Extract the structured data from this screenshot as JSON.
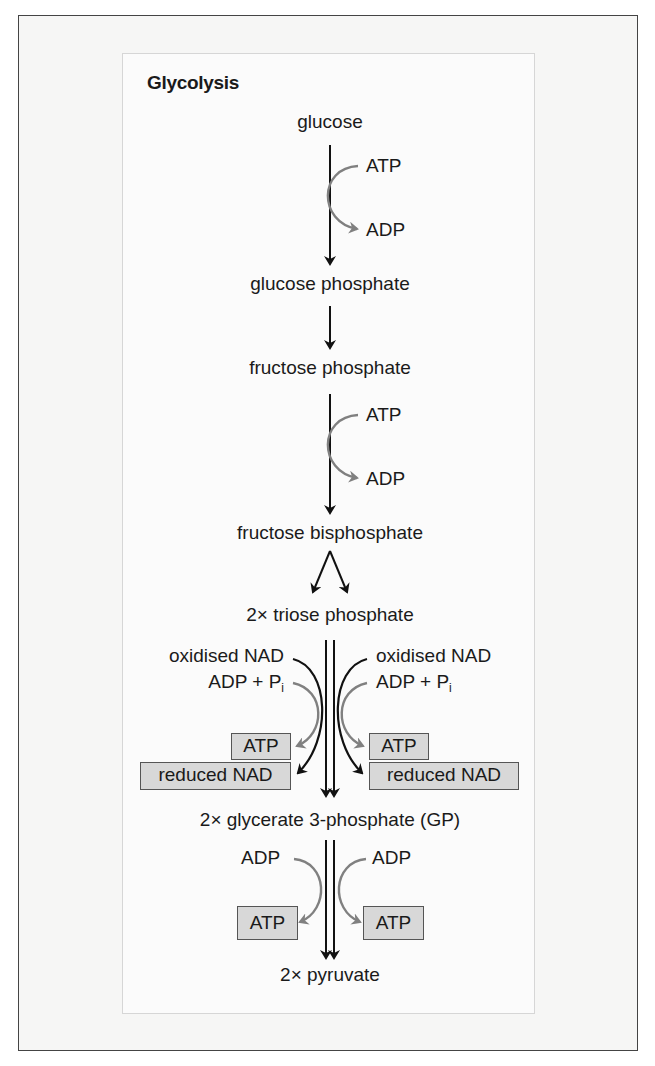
{
  "figure": {
    "title": "Glycolysis",
    "colors": {
      "frame_border": "#444444",
      "frame_bg": "#f6f6f5",
      "panel_bg": "#fbfbfb",
      "main_arrow": "#111111",
      "side_arrow_gray": "#808080",
      "box_fill": "#d8d8d8",
      "box_border": "#555555"
    }
  },
  "steps": {
    "glucose": "glucose",
    "glucose_phosphate": "glucose phosphate",
    "fructose_phosphate": "fructose phosphate",
    "fructose_bisphosphate": "fructose bisphosphate",
    "triose_phosphate": "2× triose phosphate",
    "glycerate": "2× glycerate 3-phosphate (GP)",
    "pyruvate": "2× pyruvate"
  },
  "step1": {
    "in": "ATP",
    "out": "ADP"
  },
  "step3": {
    "in": "ATP",
    "out": "ADP"
  },
  "step5": {
    "left": {
      "in1": "oxidised NAD",
      "in2": "ADP + P",
      "in2_sub": "i",
      "out_atp": "ATP",
      "out_nad": "reduced NAD"
    },
    "right": {
      "in1": "oxidised NAD",
      "in2": "ADP + P",
      "in2_sub": "i",
      "out_atp": "ATP",
      "out_nad": "reduced NAD"
    }
  },
  "step6": {
    "left": {
      "in": "ADP",
      "out": "ATP"
    },
    "right": {
      "in": "ADP",
      "out": "ATP"
    }
  }
}
